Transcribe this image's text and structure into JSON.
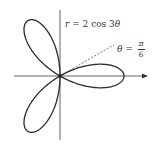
{
  "diagram": {
    "type": "polar-rose",
    "equation": {
      "var": "r",
      "eq": " = 2 cos 3",
      "theta": "θ"
    },
    "ray": {
      "theta_symbol": "θ",
      "eq": " = ",
      "numerator": "π",
      "denominator": "6"
    },
    "colors": {
      "curve": "#2a2a2a",
      "axes": "#555555",
      "ray": "#555555",
      "background": "#ffffff"
    }
  },
  "chart_data": {
    "type": "line",
    "title": "",
    "curve": "r = 2 cos 3θ",
    "coordinate_system": "polar",
    "petals": 3,
    "petal_angles_deg": [
      0,
      120,
      240
    ],
    "max_r": 2,
    "annotations": [
      "r = 2 cos 3θ",
      "θ = π/6"
    ],
    "reference_ray_angle": "π/6",
    "grid": false
  }
}
